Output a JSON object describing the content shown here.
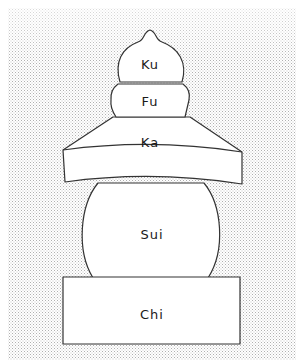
{
  "diagram": {
    "type": "gorinto-five-element-stupa",
    "colors": {
      "background_dots": "#b8b8b8",
      "shape_fill": "#ffffff",
      "outline": "#333333",
      "text": "#1a1a1a"
    },
    "elements": [
      {
        "id": "ku",
        "label": "Ku",
        "shape": "onion-dome"
      },
      {
        "id": "fu",
        "label": "Fu",
        "shape": "hemisphere-band"
      },
      {
        "id": "ka",
        "label": "Ka",
        "shape": "pyramid-roof"
      },
      {
        "id": "sui",
        "label": "Sui",
        "shape": "sphere"
      },
      {
        "id": "chi",
        "label": "Chi",
        "shape": "cube"
      }
    ]
  }
}
